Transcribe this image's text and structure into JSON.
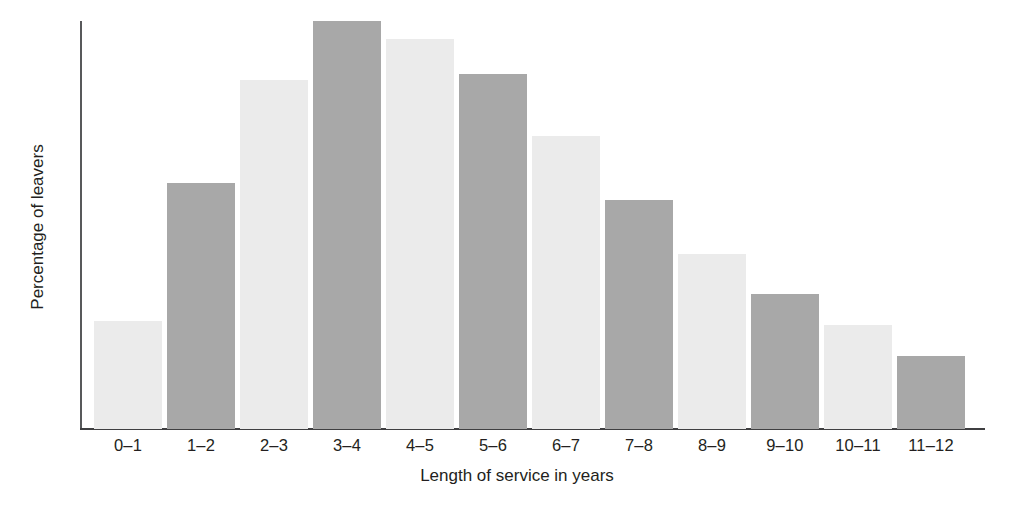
{
  "chart_data": {
    "type": "bar",
    "title": "",
    "xlabel": "Length of service in years",
    "ylabel": "Percentage of leavers",
    "categories": [
      "0–1",
      "1–2",
      "2–3",
      "3–4",
      "4–5",
      "5–6",
      "6–7",
      "7–8",
      "8–9",
      "9–10",
      "10–11",
      "11–12"
    ],
    "values": [
      26.5,
      60.2,
      85.5,
      100.0,
      95.7,
      87.0,
      71.9,
      56.1,
      42.9,
      33.2,
      25.5,
      17.9
    ],
    "value_unit": "percent of maximum bar height (no numeric axis ticks shown)",
    "bar_colors": [
      "#ebebeb",
      "#a8a8a8",
      "#ebebeb",
      "#a8a8a8",
      "#ebebeb",
      "#a8a8a8",
      "#ebebeb",
      "#a8a8a8",
      "#ebebeb",
      "#a8a8a8",
      "#ebebeb",
      "#a8a8a8"
    ],
    "ylim": [
      0,
      100
    ],
    "y_tick_labels": [],
    "x_tick_labels": [
      "0–1",
      "1–2",
      "2–3",
      "3–4",
      "4–5",
      "5–6",
      "6–7",
      "7–8",
      "8–9",
      "9–10",
      "10–11",
      "11–12"
    ],
    "grid": false,
    "legend": null,
    "annotations": []
  },
  "axes": {
    "x_title": "Length of service in years",
    "y_title": "Percentage of leavers"
  },
  "colors": {
    "bar_light": "#ebebeb",
    "bar_dark": "#a8a8a8",
    "axis": "#3f3f41",
    "text": "#231f20",
    "background": "#ffffff"
  }
}
